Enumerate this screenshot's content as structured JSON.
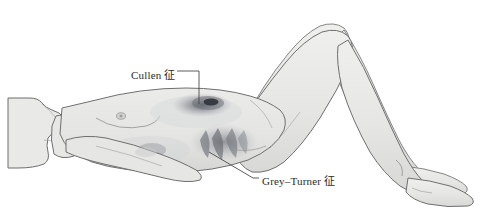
{
  "figure": {
    "type": "medical-illustration",
    "background_color": "#ffffff",
    "skin_fill": "#e8e8e6",
    "outline_color": "#6f6f6f",
    "leader_line_color": "#4a4a4a",
    "bruise_color": "#8f9298",
    "bruise_dark_color": "#4a4d54"
  },
  "annotations": [
    {
      "id": "cullen",
      "label": "Cullen 征",
      "target": "periumbilical-ecchymosis",
      "leader": "horizontal then vertical down to umbilicus"
    },
    {
      "id": "grey-turner",
      "label": "Grey–Turner 征",
      "target": "flank-ecchymosis",
      "leader": "diagonal from left flank down to label"
    }
  ]
}
